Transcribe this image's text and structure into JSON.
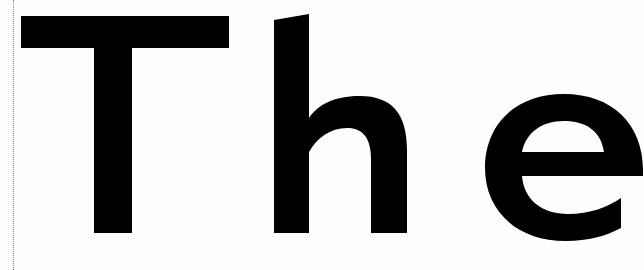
{
  "document": {
    "headline": "The",
    "letters": [
      "T",
      "h",
      "e"
    ],
    "ink_color": "#000000",
    "paper_color": "#fdfdfd",
    "margin_line_style": "dotted"
  }
}
